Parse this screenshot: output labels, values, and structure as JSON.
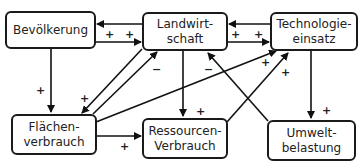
{
  "diagram": {
    "nodes": [
      {
        "id": "bevoelkerung",
        "lines": [
          "Bevölkerung"
        ]
      },
      {
        "id": "landwirtschaft",
        "lines": [
          "Landwirt-",
          "schaft"
        ]
      },
      {
        "id": "technologie",
        "lines": [
          "Technologie-",
          "einsatz"
        ]
      },
      {
        "id": "flaechen",
        "lines": [
          "Flächen-",
          "verbrauch"
        ]
      },
      {
        "id": "ressourcen",
        "lines": [
          "Ressourcen-",
          "Verbrauch"
        ]
      },
      {
        "id": "umwelt",
        "lines": [
          "Umwelt-",
          "belastung"
        ]
      }
    ],
    "edges": [
      {
        "from": "landwirtschaft",
        "to": "bevoelkerung",
        "sign": ""
      },
      {
        "from": "bevoelkerung",
        "to": "landwirtschaft",
        "sign": "+"
      },
      {
        "from": "technologie",
        "to": "landwirtschaft",
        "sign": ""
      },
      {
        "from": "landwirtschaft",
        "to": "technologie",
        "sign": "+"
      },
      {
        "from": "bevoelkerung",
        "to": "flaechen",
        "sign": "+"
      },
      {
        "from": "landwirtschaft",
        "to": "flaechen",
        "sign": "+"
      },
      {
        "from": "flaechen",
        "to": "landwirtschaft",
        "sign": "−"
      },
      {
        "from": "flaechen",
        "to": "technologie",
        "sign": "+"
      },
      {
        "from": "landwirtschaft",
        "to": "ressourcen",
        "sign": "+"
      },
      {
        "from": "ressourcen",
        "to": "technologie",
        "sign": "+"
      },
      {
        "from": "umwelt",
        "to": "landwirtschaft",
        "sign": "−"
      },
      {
        "from": "technologie",
        "to": "umwelt",
        "sign": "+"
      },
      {
        "from": "flaechen",
        "to": "ressourcen",
        "sign": "+"
      }
    ],
    "signs": {
      "plus": "+",
      "minus": "−"
    }
  }
}
